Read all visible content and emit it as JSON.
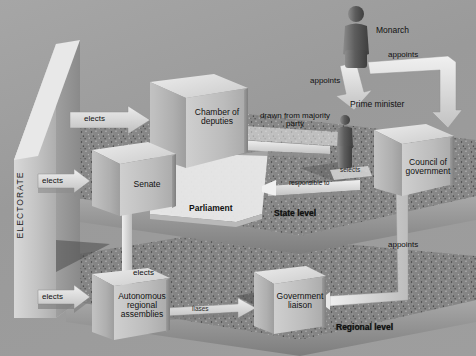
{
  "diagram": {
    "electorate_label": "ELECTORATE",
    "levels": [
      {
        "id": "state",
        "label": "State level"
      },
      {
        "id": "regional",
        "label": "Regional level"
      }
    ],
    "group_labels": [
      {
        "id": "parliament",
        "label": "Parliament"
      }
    ],
    "nodes": [
      {
        "id": "chamber-of-deputies",
        "label": "Chamber of\ndeputies",
        "line1": "Chamber of",
        "line2": "deputies",
        "line3": ""
      },
      {
        "id": "senate",
        "label": "Senate",
        "line1": "Senate",
        "line2": "",
        "line3": ""
      },
      {
        "id": "council-of-government",
        "label": "Council of\ngovernment",
        "line1": "Council of",
        "line2": "government",
        "line3": ""
      },
      {
        "id": "autonomous-regional-assemblies",
        "label": "Autonomous\nregional\nassemblies",
        "line1": "Autonomous",
        "line2": "regional",
        "line3": "assemblies"
      },
      {
        "id": "government-liaison",
        "label": "Government\nliaison",
        "line1": "Government",
        "line2": "liaison",
        "line3": ""
      }
    ],
    "people": [
      {
        "id": "monarch",
        "label": "Monarch"
      },
      {
        "id": "prime-minister",
        "label": "Prime minister"
      }
    ],
    "connectors": [
      {
        "id": "elects-chamber",
        "label": "elects"
      },
      {
        "id": "elects-senate",
        "label": "elects"
      },
      {
        "id": "elects-regional-assemblies",
        "label": "elects"
      },
      {
        "id": "elects-senate-from-regional",
        "label": "elects"
      },
      {
        "id": "drawn-from-majority-party",
        "label": "drawn from majority\nparty",
        "line1": "drawn from majority",
        "line2": "party"
      },
      {
        "id": "appoints-prime-minister",
        "label": "appoints"
      },
      {
        "id": "appoints-council",
        "label": "appoints"
      },
      {
        "id": "appoints-liaison",
        "label": "appoints"
      },
      {
        "id": "responsible-to",
        "label": "responsible to"
      },
      {
        "id": "selects",
        "label": "selects"
      },
      {
        "id": "liaises",
        "label": "liases"
      }
    ],
    "colors": {
      "background": "#9b9b9b",
      "slab_face": "#8b8b8b",
      "box_front": "#b8b8b8",
      "box_top": "#dcdcdc",
      "arrow_fill": "#e2e2e2",
      "text": "#111111",
      "white_text": "#ffffff"
    }
  }
}
